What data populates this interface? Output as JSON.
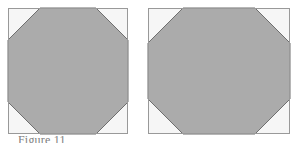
{
  "figure": {
    "caption": "Figure 11",
    "background_color": "#ffffff",
    "fill_color": "#ababab",
    "corner_color": "#f6f6f6",
    "border_color": "#999999",
    "outline_color": "#6f6f6f",
    "panels": [
      {
        "name": "left-panel",
        "label": "square-with-octagon",
        "shape": "octagon",
        "frame": {
          "x": 8,
          "y": 8,
          "width": 120,
          "height": 126
        },
        "corner_cut": 32,
        "octagon_points": "40,8 96,8 128,40 128,102 96,134 40,134 8,102 8,40"
      },
      {
        "name": "right-panel",
        "label": "rectangle-with-octagon",
        "shape": "octagon",
        "frame": {
          "x": 148,
          "y": 8,
          "width": 142,
          "height": 126
        },
        "corner_cut": 35,
        "octagon_points": "183,8 255,8 290,43 290,99 255,134 183,134 148,99 148,43"
      }
    ]
  }
}
